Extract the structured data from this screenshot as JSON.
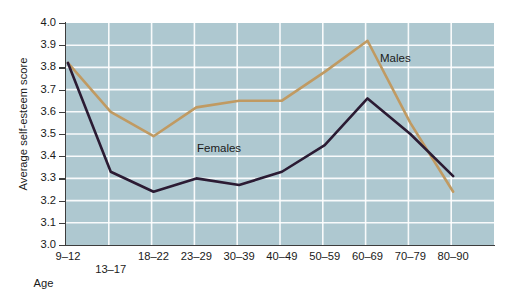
{
  "chart_data": {
    "type": "line",
    "title": "",
    "xlabel": "Age",
    "ylabel": "Average self-esteem score",
    "categories": [
      "9–12",
      "13–17",
      "18–22",
      "23–29",
      "30–39",
      "40–49",
      "50–59",
      "60–69",
      "70–79",
      "80–90"
    ],
    "ylim": [
      3.0,
      4.0
    ],
    "ytick_labels": [
      "4.0",
      "3.9",
      "3.8",
      "3.7",
      "3.6",
      "3.5",
      "3.4",
      "3.3",
      "3.2",
      "3.1",
      "3.0"
    ],
    "ytick_values": [
      4.0,
      3.9,
      3.8,
      3.7,
      3.6,
      3.5,
      3.4,
      3.3,
      3.2,
      3.1,
      3.0
    ],
    "grid": true,
    "grid_color": "#ffffff",
    "plot_background": "#aec8d0",
    "legend_position": "inline-annotations",
    "series": [
      {
        "name": "Males",
        "color": "#c09a62",
        "values": [
          3.82,
          3.6,
          3.49,
          3.62,
          3.65,
          3.65,
          3.78,
          3.92,
          3.55,
          3.24
        ]
      },
      {
        "name": "Females",
        "color": "#2b1b33",
        "values": [
          3.82,
          3.33,
          3.24,
          3.3,
          3.27,
          3.33,
          3.45,
          3.66,
          3.5,
          3.31
        ]
      }
    ],
    "annotations": [
      {
        "text": "Males",
        "x_category": "70–79",
        "y_value": 3.87
      },
      {
        "text": "Females",
        "x_category": "30–39",
        "y_value": 3.42
      }
    ]
  }
}
